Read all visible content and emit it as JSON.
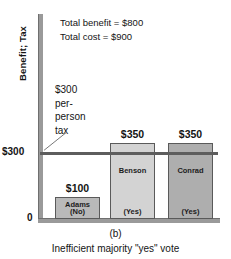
{
  "chart_data": {
    "type": "bar",
    "title": "",
    "panel_label": "(b)",
    "caption": "Inefficient majority \"yes\" vote",
    "ylabel": "Benefit; Tax",
    "xlabel": "",
    "ylim": [
      0,
      1000
    ],
    "grid": false,
    "legend": "none",
    "categories": [
      "Adams",
      "Benson",
      "Conrad"
    ],
    "values": [
      100,
      350,
      350
    ],
    "value_labels": [
      "$100",
      "$350",
      "$350"
    ],
    "votes": [
      "(No)",
      "(Yes)",
      "(Yes)"
    ],
    "bar_colors": [
      "#b9b9b9",
      "#d3d3d3",
      "#aeaeae"
    ],
    "y_ticks": [
      {
        "value": 0,
        "label": "0"
      },
      {
        "value": 300,
        "label": "$300"
      }
    ],
    "reference_line": {
      "value": 300,
      "label_lines": [
        "$300",
        "per-",
        "person",
        "tax"
      ],
      "color": "#5d5d5d"
    },
    "annotations": [
      "Total benefit = $800",
      "Total cost = $900"
    ],
    "totals": {
      "benefit_label": "Total benefit = $800",
      "cost_label": "Total cost = $900"
    }
  }
}
